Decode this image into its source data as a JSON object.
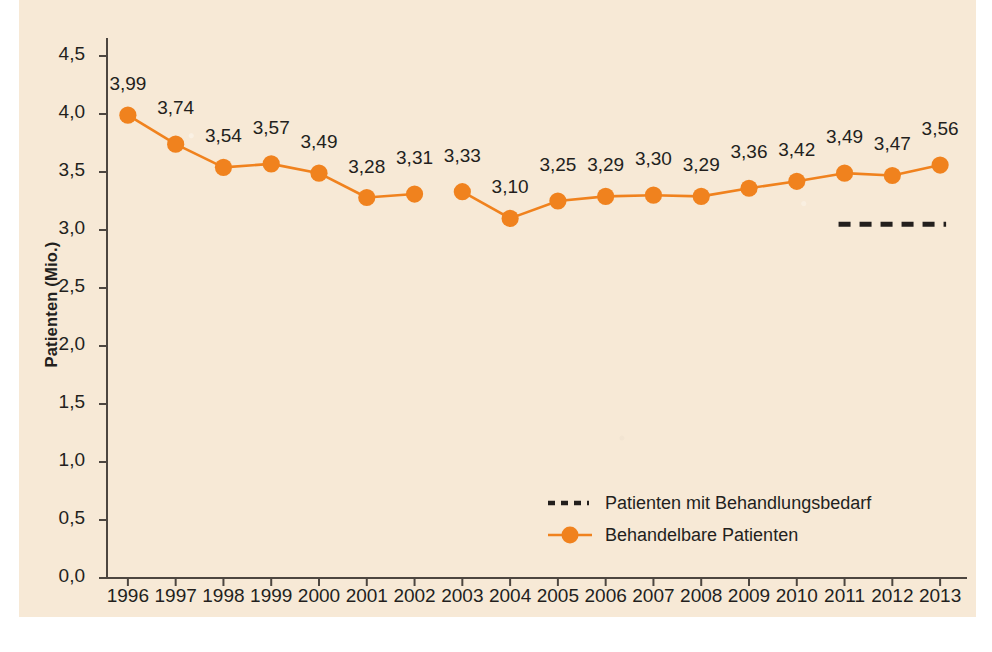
{
  "figure": {
    "background_color": "#ffffff",
    "panel_color": "#f7e9d6",
    "accent_color": "#f0821e",
    "text_color": "#231f1d"
  },
  "chart_data": {
    "type": "line",
    "title": "",
    "xlabel": "",
    "ylabel": "Patienten (Mio.)",
    "ylim": [
      0.0,
      4.5
    ],
    "ytick_labels": [
      "0,0",
      "0,5",
      "1,0",
      "1,5",
      "2,0",
      "2,5",
      "3,0",
      "3,5",
      "4,0",
      "4,5"
    ],
    "ytick_values": [
      0.0,
      0.5,
      1.0,
      1.5,
      2.0,
      2.5,
      3.0,
      3.5,
      4.0,
      4.5
    ],
    "grid": false,
    "legend_position": "lower center",
    "categories": [
      "1996",
      "1997",
      "1998",
      "1999",
      "2000",
      "2001",
      "2002",
      "2003",
      "2004",
      "2005",
      "2006",
      "2007",
      "2008",
      "2009",
      "2010",
      "2011",
      "2012",
      "2013"
    ],
    "series": [
      {
        "name": "Behandelbare Patienten",
        "style": "solid-line-with-round-markers",
        "color": "#f0821e",
        "values": [
          3.99,
          3.74,
          3.54,
          3.57,
          3.49,
          3.28,
          3.31,
          3.33,
          3.1,
          3.25,
          3.29,
          3.3,
          3.29,
          3.36,
          3.42,
          3.49,
          3.47,
          3.56
        ],
        "value_labels": [
          "3,99",
          "3,74",
          "3,54",
          "3,57",
          "3,49",
          "3,28",
          "3,31",
          "3,33",
          "3,10",
          "3,25",
          "3,29",
          "3,30",
          "3,29",
          "3,36",
          "3,42",
          "3,49",
          "3,47",
          "3,56"
        ],
        "line_breaks_after": [
          "2002"
        ]
      },
      {
        "name": "Patienten mit Behandlungsbedarf",
        "style": "dashed-line",
        "color": "#231f1d",
        "segment_x_range": [
          "2011",
          "2013"
        ],
        "segment_value": 3.05,
        "values": [
          null,
          null,
          null,
          null,
          null,
          null,
          null,
          null,
          null,
          null,
          null,
          null,
          null,
          null,
          null,
          3.05,
          3.05,
          3.05
        ]
      }
    ],
    "annotations": []
  },
  "legend": {
    "items": [
      {
        "label": "Patienten mit Behandlungsbedarf",
        "marker": "dashed-line-swatch",
        "color": "#231f1d"
      },
      {
        "label": "Behandelbare Patienten",
        "marker": "line-dot-swatch",
        "color": "#f0821e"
      }
    ]
  }
}
